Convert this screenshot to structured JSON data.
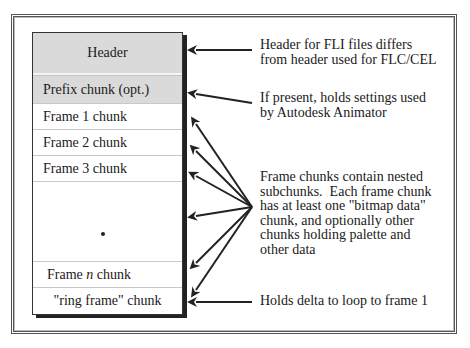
{
  "diagram": {
    "stack": {
      "rows": [
        {
          "label": "Header",
          "shaded": true
        },
        {
          "label": "Prefix chunk (opt.)",
          "shaded": true
        },
        {
          "label": "Frame 1 chunk",
          "shaded": false
        },
        {
          "label": "Frame 2 chunk",
          "shaded": false
        },
        {
          "label": "Frame 3 chunk",
          "shaded": false
        },
        {
          "label": "•",
          "shaded": false
        },
        {
          "label_prefix": "Frame ",
          "label_italic": "n",
          "label_suffix": " chunk",
          "shaded": false
        },
        {
          "label": "\"ring frame\" chunk",
          "shaded": false
        }
      ]
    },
    "annotations": [
      {
        "text": "Header for FLI files differs\nfrom header used for FLC/CEL",
        "points_to": [
          "Header"
        ]
      },
      {
        "text": "If present, holds settings used\nby Autodesk Animator",
        "points_to": [
          "Prefix chunk (opt.)"
        ]
      },
      {
        "text": "Frame chunks contain nested\nsubchunks.  Each frame chunk\nhas at least one \"bitmap data\"\nchunk, and optionally other\nchunks holding palette and\nother data",
        "points_to": [
          "Frame 1 chunk",
          "Frame 2 chunk",
          "Frame 3 chunk",
          "•",
          "Frame n chunk",
          "\"ring frame\" chunk"
        ]
      },
      {
        "text": "Holds delta to loop to frame 1",
        "points_to": [
          "\"ring frame\" chunk"
        ]
      }
    ],
    "colors": {
      "shaded_row": "#dadada",
      "line": "#222222",
      "frame": "#555555"
    }
  }
}
